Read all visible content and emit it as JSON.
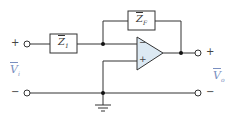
{
  "diagram": {
    "type": "inverting op-amp circuit",
    "components": {
      "input_impedance": {
        "label": "Z",
        "sub": "1"
      },
      "feedback_impedance": {
        "label": "Z",
        "sub": "F"
      },
      "opamp": {
        "inverting_sign": "−",
        "noninverting_sign": "+"
      }
    },
    "terminals": {
      "input": {
        "plus": "+",
        "minus": "−",
        "label": "V",
        "sub": "i"
      },
      "output": {
        "plus": "+",
        "minus": "−",
        "label": "V",
        "sub": "o"
      }
    },
    "colors": {
      "wire": "#333333",
      "opamp_fill": "#dce9f3",
      "voltage_label": "#7a8fc0"
    }
  }
}
